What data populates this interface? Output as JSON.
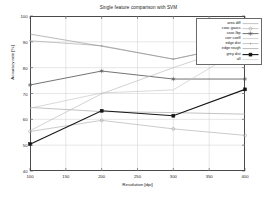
{
  "chart_data": {
    "type": "line",
    "title": "Single feature comparison with SVM",
    "xlabel": "Resolution [dpi]",
    "ylabel": "Accuracy rate [%]",
    "xlim": [
      100,
      400
    ],
    "ylim": [
      40,
      100
    ],
    "xticks": [
      100,
      150,
      200,
      250,
      300,
      350,
      400
    ],
    "yticks": [
      40,
      50,
      60,
      70,
      80,
      90,
      100
    ],
    "grid": true,
    "legend_position": "top-right",
    "x": [
      100,
      200,
      300,
      400
    ],
    "series": [
      {
        "name": "area diff",
        "values": [
          64.6,
          63.0,
          62.6,
          62.0
        ],
        "color": "#9a9a9a",
        "marker": "none",
        "width": 0.6
      },
      {
        "name": "cooc gauss",
        "values": [
          55.3,
          59.6,
          56.3,
          53.8
        ],
        "color": "#a8a8a8",
        "marker": "circle",
        "width": 0.6
      },
      {
        "name": "cooc lbp",
        "values": [
          73.3,
          78.7,
          75.6,
          75.6
        ],
        "color": "#4f4f4f",
        "marker": "star",
        "width": 0.8
      },
      {
        "name": "corr coeff",
        "values": [
          55.6,
          69.9,
          80.0,
          89.4
        ],
        "color": "#b4b4b4",
        "marker": "none",
        "width": 0.6
      },
      {
        "name": "edge dist",
        "values": [
          90.4,
          88.5,
          83.3,
          89.2
        ],
        "color": "#9e9e9e",
        "marker": "dot",
        "width": 0.6
      },
      {
        "name": "edge rough",
        "values": [
          93.0,
          88.3,
          83.3,
          89.2
        ],
        "color": "#8c8c8c",
        "marker": "none",
        "width": 0.6
      },
      {
        "name": "grey dist",
        "values": [
          50.4,
          63.3,
          61.4,
          71.6
        ],
        "color": "#151515",
        "marker": "square",
        "width": 1.1
      },
      {
        "name": "all",
        "values": [
          64.3,
          70.2,
          71.4,
          88.0
        ],
        "color": "#c0c0c0",
        "marker": "none",
        "width": 0.6
      }
    ]
  },
  "legend": {
    "items": [
      "area diff",
      "cooc gauss",
      "cooc lbp",
      "corr coeff",
      "edge dist",
      "edge rough",
      "grey dist",
      "all"
    ]
  }
}
